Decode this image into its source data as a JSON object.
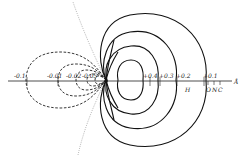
{
  "diagram": {
    "type": "contour plot of orbital wavefunction",
    "axis_unit": "Å",
    "positive_contours": [
      {
        "label": "+0.4"
      },
      {
        "label": "+0.3"
      },
      {
        "label": "+0.2"
      },
      {
        "label": "+0.1"
      }
    ],
    "negative_contours": [
      {
        "label": "-0.1"
      },
      {
        "label": "-0.01"
      },
      {
        "label": "-0.02"
      },
      {
        "label": "-0.05"
      }
    ],
    "atom_labels": {
      "h": "H",
      "o": "O",
      "n": "N",
      "c": "C"
    },
    "colors": {
      "line": "#111111",
      "nodal": "#888888",
      "background": "#ffffff"
    }
  }
}
